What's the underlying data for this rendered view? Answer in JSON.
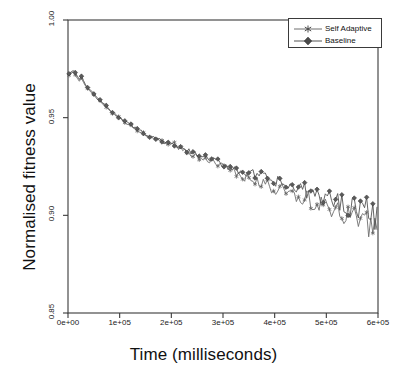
{
  "chart_data": {
    "type": "line",
    "title": "",
    "subtitle": "",
    "xlabel": "Time (milliseconds)",
    "ylabel": "Normalised fitness value",
    "xlim": [
      0,
      600000
    ],
    "ylim": [
      0.85,
      1.0
    ],
    "xticks": [
      0,
      100000,
      200000,
      300000,
      400000,
      500000,
      600000
    ],
    "xticklabels": [
      "0e+00",
      "1e+05",
      "2e+05",
      "3e+05",
      "4e+05",
      "5e+05",
      "6e+05"
    ],
    "yticks": [
      0.85,
      0.9,
      0.95,
      1.0
    ],
    "yticklabels": [
      "0.85",
      "0.90",
      "0.95",
      "1.00"
    ],
    "grid": false,
    "legend_position": "top-right",
    "legend_entries": [
      {
        "name": "Self Adaptive",
        "marker": "asterisk-marker",
        "color": "#6e6e6e"
      },
      {
        "name": "Baseline",
        "marker": "filled-diamond-marker",
        "color": "#555555"
      }
    ],
    "x": [
      2000,
      6000,
      10000,
      14000,
      18000,
      22000,
      26000,
      30000,
      34000,
      38000,
      42000,
      46000,
      50000,
      54000,
      58000,
      62000,
      66000,
      70000,
      74000,
      78000,
      82000,
      86000,
      90000,
      94000,
      98000,
      102000,
      106000,
      110000,
      114000,
      118000,
      122000,
      126000,
      130000,
      134000,
      138000,
      142000,
      146000,
      150000,
      154000,
      158000,
      162000,
      166000,
      170000,
      174000,
      178000,
      182000,
      186000,
      190000,
      194000,
      198000,
      202000,
      206000,
      210000,
      214000,
      218000,
      222000,
      226000,
      230000,
      234000,
      238000,
      242000,
      246000,
      250000,
      254000,
      258000,
      262000,
      266000,
      270000,
      274000,
      278000,
      282000,
      286000,
      290000,
      294000,
      298000,
      302000,
      306000,
      310000,
      314000,
      318000,
      322000,
      326000,
      330000,
      334000,
      338000,
      342000,
      346000,
      350000,
      354000,
      358000,
      362000,
      366000,
      370000,
      374000,
      378000,
      382000,
      386000,
      390000,
      394000,
      398000,
      402000,
      406000,
      410000,
      414000,
      418000,
      422000,
      426000,
      430000,
      434000,
      438000,
      442000,
      446000,
      450000,
      454000,
      458000,
      462000,
      466000,
      470000,
      474000,
      478000,
      482000,
      486000,
      490000,
      494000,
      498000,
      502000,
      506000,
      510000,
      514000,
      518000,
      522000,
      526000,
      530000,
      534000,
      538000,
      542000,
      546000,
      550000,
      554000,
      558000,
      562000,
      566000,
      570000,
      574000,
      578000,
      582000,
      586000,
      590000,
      594000,
      598000
    ],
    "series": [
      {
        "name": "Self Adaptive",
        "marker": "asterisk-marker",
        "color": "#6e6e6e",
        "values": [
          0.9715,
          0.9728,
          0.9735,
          0.9722,
          0.9702,
          0.9688,
          0.9703,
          0.968,
          0.9661,
          0.965,
          0.9638,
          0.9628,
          0.9616,
          0.9603,
          0.9592,
          0.9585,
          0.9572,
          0.9563,
          0.9552,
          0.9545,
          0.9534,
          0.9526,
          0.9518,
          0.9509,
          0.95,
          0.9494,
          0.9485,
          0.9478,
          0.947,
          0.9464,
          0.9456,
          0.945,
          0.9443,
          0.9437,
          0.943,
          0.9425,
          0.9419,
          0.9413,
          0.9408,
          0.9402,
          0.9398,
          0.9392,
          0.9387,
          0.9383,
          0.9378,
          0.9374,
          0.937,
          0.9366,
          0.9362,
          0.9358,
          0.9375,
          0.9368,
          0.9352,
          0.9346,
          0.934,
          0.9336,
          0.933,
          0.9326,
          0.932,
          0.9316,
          0.931,
          0.9306,
          0.9302,
          0.9296,
          0.9292,
          0.9288,
          0.9283,
          0.9278,
          0.9274,
          0.9269,
          0.9266,
          0.926,
          0.9256,
          0.9252,
          0.9248,
          0.9243,
          0.9238,
          0.9234,
          0.923,
          0.9226,
          0.9221,
          0.9218,
          0.9213,
          0.9208,
          0.9204,
          0.92,
          0.9196,
          0.9192,
          0.9188,
          0.9184,
          0.918,
          0.9176,
          0.9172,
          0.9168,
          0.9164,
          0.916,
          0.9156,
          0.9152,
          0.9148,
          0.9144,
          0.914,
          0.9136,
          0.9132,
          0.9128,
          0.9124,
          0.912,
          0.9116,
          0.9112,
          0.9108,
          0.9104,
          0.91,
          0.9096,
          0.9092,
          0.9088,
          0.9084,
          0.908,
          0.9076,
          0.9072,
          0.9068,
          0.9064,
          0.906,
          0.9056,
          0.9052,
          0.9048,
          0.9044,
          0.904,
          0.9036,
          0.9032,
          0.9028,
          0.9024,
          0.902,
          0.9016,
          0.9012,
          0.9008,
          0.9004,
          0.9,
          0.8996,
          0.8992,
          0.8988,
          0.8984,
          0.898,
          0.8976,
          0.8972,
          0.8968,
          0.8962,
          0.8956,
          0.8948,
          0.894,
          0.8932,
          0.8924
        ]
      },
      {
        "name": "Baseline",
        "marker": "filled-diamond-marker",
        "color": "#555555",
        "values": [
          0.9722,
          0.9738,
          0.9742,
          0.973,
          0.9712,
          0.9696,
          0.971,
          0.9686,
          0.9668,
          0.9656,
          0.9644,
          0.9634,
          0.9622,
          0.9609,
          0.9598,
          0.959,
          0.9578,
          0.9568,
          0.9558,
          0.955,
          0.954,
          0.9531,
          0.9523,
          0.9514,
          0.9505,
          0.9498,
          0.949,
          0.9483,
          0.9475,
          0.9468,
          0.9461,
          0.9454,
          0.9448,
          0.9441,
          0.9435,
          0.9429,
          0.9423,
          0.9418,
          0.9412,
          0.9407,
          0.9402,
          0.9396,
          0.9392,
          0.9387,
          0.9383,
          0.9378,
          0.9374,
          0.937,
          0.9366,
          0.9362,
          0.9358,
          0.9354,
          0.935,
          0.9346,
          0.9342,
          0.9338,
          0.9334,
          0.933,
          0.9326,
          0.9322,
          0.9318,
          0.9314,
          0.931,
          0.9306,
          0.9302,
          0.9298,
          0.9294,
          0.929,
          0.9286,
          0.9282,
          0.9278,
          0.9275,
          0.9271,
          0.9267,
          0.9263,
          0.9259,
          0.9256,
          0.9252,
          0.9248,
          0.9244,
          0.9241,
          0.9237,
          0.9233,
          0.923,
          0.9226,
          0.9222,
          0.9219,
          0.9215,
          0.9212,
          0.9208,
          0.9205,
          0.9201,
          0.9198,
          0.9194,
          0.9191,
          0.9187,
          0.9184,
          0.918,
          0.9177,
          0.9173,
          0.917,
          0.9166,
          0.9163,
          0.916,
          0.9156,
          0.9153,
          0.915,
          0.9146,
          0.9143,
          0.914,
          0.9136,
          0.9133,
          0.913,
          0.9126,
          0.9123,
          0.912,
          0.9117,
          0.9113,
          0.911,
          0.9107,
          0.9104,
          0.91,
          0.9097,
          0.9094,
          0.9091,
          0.9088,
          0.9084,
          0.9081,
          0.9078,
          0.9075,
          0.9072,
          0.9069,
          0.9066,
          0.9062,
          0.9059,
          0.9056,
          0.9053,
          0.905,
          0.9047,
          0.9044,
          0.9041,
          0.9038,
          0.9035,
          0.9032,
          0.9026,
          0.902,
          0.9013,
          0.9006,
          0.8999,
          0.8992
        ]
      }
    ],
    "noise": {
      "amplitude_start": 0.0004,
      "amplitude_end": 0.0075,
      "seed_self_adaptive": 1337,
      "seed_baseline": 4242
    },
    "axis_color": "#3a3a3a",
    "background": "#ffffff"
  }
}
